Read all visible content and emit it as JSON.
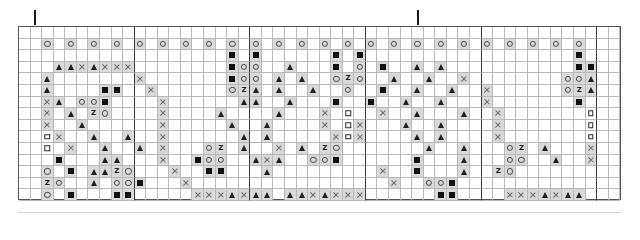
{
  "chart_data": {
    "type": "heatmap",
    "title": "",
    "subtitle": "",
    "xlabel": "",
    "ylabel": "",
    "grid": true,
    "legend_position": "none",
    "columns": 52,
    "rows": 15,
    "cell_px": 11.6,
    "heavy_line_every": 10,
    "symbol_key": {
      "tri": "filled-triangle",
      "sq": "filled-square",
      "osq": "open-square",
      "cir": "open-circle",
      "x": "cross-stitch-x",
      "z": "letter-z",
      "": "empty"
    },
    "shaded_symbols": [
      "tri",
      "sq",
      "cir",
      "x",
      "z"
    ],
    "colors": {
      "grid_light": "#b9b9b9",
      "grid_heavy": "#3a3a3a",
      "border": "#555555",
      "cell_shade": "#d9d9d9",
      "symbol_dark": "#1f1f1f",
      "symbol_mid": "#6a6a6a",
      "background": "#ffffff"
    },
    "tick_marks": [
      {
        "column": 1,
        "label": ""
      },
      {
        "column": 34,
        "label": ""
      }
    ],
    "cells": [
      [
        "",
        "",
        "",
        "",
        "",
        "",
        "",
        "",
        "",
        "",
        "",
        "",
        "",
        "",
        "",
        "",
        "",
        "",
        "",
        "",
        "",
        "",
        "",
        "",
        "",
        "",
        "",
        "",
        "",
        "",
        "",
        "",
        "",
        "",
        "",
        "",
        "",
        "",
        "",
        "",
        "",
        "",
        "",
        "",
        "",
        "",
        "",
        "",
        "",
        "",
        "",
        ""
      ],
      [
        "",
        "",
        "cir",
        "",
        "cir",
        "",
        "cir",
        "",
        "cir",
        "",
        "cir",
        "",
        "cir",
        "",
        "cir",
        "",
        "cir",
        "",
        "cir",
        "",
        "cir",
        "",
        "cir",
        "",
        "cir",
        "",
        "cir",
        "",
        "cir",
        "",
        "cir",
        "",
        "cir",
        "",
        "cir",
        "",
        "cir",
        "",
        "cir",
        "",
        "cir",
        "",
        "cir",
        "",
        "cir",
        "",
        "cir",
        "",
        "cir",
        "",
        "",
        ""
      ],
      [
        "",
        "",
        "",
        "",
        "",
        "",
        "",
        "",
        "",
        "",
        "",
        "",
        "",
        "",
        "",
        "",
        "",
        "",
        "sq",
        "",
        "sq",
        "",
        "",
        "",
        "",
        "",
        "",
        "sq",
        "",
        "sq",
        "",
        "",
        "",
        "",
        "",
        "",
        "",
        "",
        "",
        "",
        "",
        "",
        "",
        "",
        "",
        "",
        "",
        "",
        "sq",
        "",
        "",
        ""
      ],
      [
        "",
        "",
        "",
        "tri",
        "tri",
        "x",
        "tri",
        "x",
        "x",
        "x",
        "",
        "",
        "",
        "",
        "",
        "",
        "",
        "",
        "sq",
        "cir",
        "cir",
        "",
        "",
        "tri",
        "",
        "",
        "",
        "sq",
        "",
        "cir",
        "",
        "sq",
        "",
        "",
        "tri",
        "",
        "tri",
        "",
        "",
        "",
        "",
        "",
        "",
        "",
        "",
        "",
        "",
        "",
        "sq",
        "sq",
        "",
        ""
      ],
      [
        "",
        "",
        "tri",
        "",
        "",
        "",
        "",
        "",
        "",
        "",
        "x",
        "",
        "",
        "",
        "",
        "",
        "",
        "",
        "sq",
        "cir",
        "cir",
        "",
        "tri",
        "",
        "tri",
        "",
        "",
        "cir",
        "z",
        "cir",
        "",
        "",
        "tri",
        "",
        "",
        "tri",
        "",
        "",
        "x",
        "",
        "",
        "",
        "",
        "",
        "",
        "",
        "",
        "cir",
        "cir",
        "tri",
        "",
        ""
      ],
      [
        "",
        "",
        "tri",
        "",
        "",
        "",
        "",
        "sq",
        "sq",
        "",
        "",
        "x",
        "",
        "",
        "",
        "",
        "",
        "",
        "cir",
        "z",
        "tri",
        "",
        "tri",
        "",
        "",
        "tri",
        "",
        "",
        "cir",
        "",
        "",
        "sq",
        "",
        "",
        "tri",
        "",
        "",
        "tri",
        "",
        "",
        "x",
        "",
        "",
        "",
        "",
        "",
        "",
        "cir",
        "z",
        "tri",
        "",
        ""
      ],
      [
        "",
        "",
        "x",
        "tri",
        "",
        "cir",
        "cir",
        "sq",
        "",
        "",
        "",
        "",
        "x",
        "",
        "",
        "",
        "",
        "",
        "",
        "tri",
        "tri",
        "",
        "",
        "tri",
        "",
        "",
        "",
        "sq",
        "",
        "",
        "sq",
        "",
        "",
        "tri",
        "",
        "",
        "tri",
        "",
        "",
        "",
        "x",
        "",
        "",
        "",
        "",
        "",
        "",
        "",
        "sq",
        "",
        "",
        ""
      ],
      [
        "",
        "",
        "x",
        "",
        "tri",
        "",
        "z",
        "cir",
        "",
        "",
        "",
        "",
        "x",
        "",
        "",
        "",
        "",
        "tri",
        "",
        "",
        "",
        "",
        "tri",
        "",
        "",
        "",
        "x",
        "",
        "osq",
        "",
        "",
        "x",
        "",
        "",
        "tri",
        "",
        "",
        "",
        "tri",
        "",
        "",
        "x",
        "",
        "",
        "",
        "",
        "",
        "",
        "",
        "osq",
        "",
        "",
        ""
      ],
      [
        "",
        "",
        "x",
        "",
        "",
        "tri",
        "",
        "",
        "",
        "",
        "",
        "",
        "x",
        "",
        "",
        "",
        "",
        "",
        "tri",
        "",
        "",
        "tri",
        "",
        "",
        "",
        "",
        "x",
        "",
        "osq",
        "x",
        "",
        "",
        "",
        "tri",
        "",
        "",
        "tri",
        "",
        "",
        "",
        "",
        "x",
        "",
        "",
        "",
        "",
        "",
        "",
        "",
        "osq",
        "",
        "",
        ""
      ],
      [
        "",
        "",
        "osq",
        "x",
        "",
        "",
        "tri",
        "",
        "",
        "tri",
        "",
        "",
        "x",
        "",
        "",
        "",
        "",
        "",
        "",
        "tri",
        "",
        "tri",
        "",
        "",
        "",
        "",
        "",
        "x",
        "osq",
        "x",
        "",
        "",
        "",
        "",
        "tri",
        "",
        "tri",
        "",
        "",
        "",
        "",
        "x",
        "",
        "",
        "",
        "",
        "",
        "",
        "",
        "osq",
        "",
        "",
        ""
      ],
      [
        "",
        "",
        "osq",
        "",
        "x",
        "",
        "",
        "tri",
        "",
        "",
        "tri",
        "",
        "x",
        "",
        "",
        "",
        "cir",
        "z",
        "",
        "tri",
        "",
        "",
        "x",
        "",
        "tri",
        "",
        "z",
        "cir",
        "",
        "",
        "",
        "",
        "",
        "",
        "",
        "tri",
        "",
        "",
        "tri",
        "",
        "",
        "",
        "cir",
        "z",
        "",
        "tri",
        "",
        "",
        "",
        "x",
        "",
        "",
        ""
      ],
      [
        "",
        "",
        "",
        "sq",
        "",
        "",
        "",
        "tri",
        "tri",
        "",
        "",
        "",
        "x",
        "",
        "",
        "sq",
        "cir",
        "cir",
        "",
        "",
        "tri",
        "x",
        "tri",
        "",
        "",
        "cir",
        "cir",
        "sq",
        "",
        "",
        "",
        "",
        "",
        "",
        "sq",
        "",
        "",
        "",
        "tri",
        "",
        "",
        "",
        "cir",
        "cir",
        "",
        "",
        "tri",
        "",
        "",
        "x",
        "",
        "",
        ""
      ],
      [
        "",
        "",
        "cir",
        "",
        "sq",
        "",
        "tri",
        "tri",
        "z",
        "cir",
        "",
        "",
        "",
        "x",
        "",
        "",
        "sq",
        "sq",
        "",
        "",
        "",
        "tri",
        "",
        "",
        "",
        "",
        "",
        "",
        "",
        "",
        "",
        "x",
        "",
        "",
        "sq",
        "",
        "",
        "",
        "tri",
        "",
        "",
        "z",
        "cir",
        "",
        "",
        "",
        "",
        "",
        "",
        "",
        "",
        ""
      ],
      [
        "",
        "",
        "z",
        "cir",
        "",
        "",
        "tri",
        "",
        "cir",
        "cir",
        "sq",
        "",
        "",
        "",
        "x",
        "",
        "",
        "",
        "",
        "",
        "",
        "",
        "",
        "",
        "",
        "",
        "",
        "",
        "",
        "",
        "",
        "",
        "x",
        "",
        "",
        "cir",
        "cir",
        "sq",
        "",
        "",
        "",
        "",
        "",
        "",
        "",
        "",
        "",
        "",
        "",
        "",
        "",
        "",
        ""
      ],
      [
        "",
        "",
        "cir",
        "",
        "sq",
        "",
        "",
        "",
        "sq",
        "sq",
        "",
        "",
        "",
        "",
        "",
        "x",
        "x",
        "x",
        "tri",
        "x",
        "tri",
        "tri",
        "",
        "tri",
        "tri",
        "x",
        "tri",
        "x",
        "x",
        "x",
        "",
        "",
        "",
        "",
        "",
        "",
        "sq",
        "sq",
        "",
        "",
        "",
        "",
        "x",
        "x",
        "x",
        "tri",
        "x",
        "tri",
        "tri",
        "",
        "",
        ""
      ]
    ]
  }
}
